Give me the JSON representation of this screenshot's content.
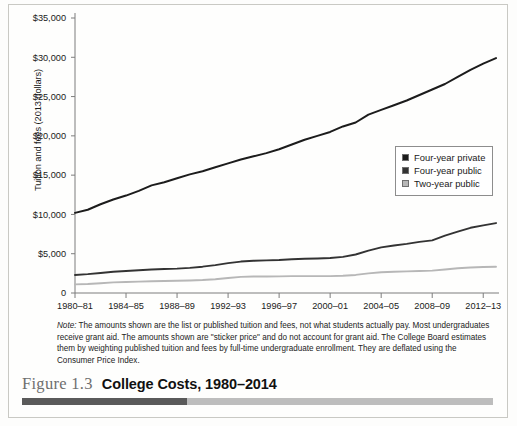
{
  "figure": {
    "number_label": "Figure 1.3",
    "title": "College Costs, 1980–2014",
    "note_label": "Note:",
    "note_text": " The amounts shown are the list or published tuition and fees, not what students actually pay. Most undergraduates receive grant aid. The amounts shown are \"sticker price\" and do not account for grant aid. The College Board estimates them by weighting published tuition and fees by full-time undergraduate enrollment. They are deflated using the Consumer Price Index."
  },
  "legend": {
    "position": "inside-right-middle",
    "items": [
      {
        "label": "Four-year private",
        "color": "#1c1c1c"
      },
      {
        "label": "Four-year public",
        "color": "#333333"
      },
      {
        "label": "Two-year public",
        "color": "#b7b7b7"
      }
    ]
  },
  "chart_data": {
    "type": "line",
    "title": "College Costs, 1980–2014",
    "xlabel": "",
    "ylabel": "Tuition and fees (2013 dollars)",
    "ylim": [
      0,
      35000
    ],
    "ytick_labels": [
      "0",
      "$5,000",
      "$10,000",
      "$15,000",
      "$20,000",
      "$25,000",
      "$30,000",
      "$35,000"
    ],
    "ytick_values": [
      0,
      5000,
      10000,
      15000,
      20000,
      25000,
      30000,
      35000
    ],
    "grid": false,
    "xtick_labels": [
      "1980–81",
      "1984–85",
      "1988–89",
      "1992–93",
      "1996–97",
      "2000–01",
      "2004–05",
      "2008–09",
      "2012–13"
    ],
    "x": [
      "1980-81",
      "1981-82",
      "1982-83",
      "1983-84",
      "1984-85",
      "1985-86",
      "1986-87",
      "1987-88",
      "1988-89",
      "1989-90",
      "1990-91",
      "1991-92",
      "1992-93",
      "1993-94",
      "1994-95",
      "1995-96",
      "1996-97",
      "1997-98",
      "1998-99",
      "1999-00",
      "2000-01",
      "2001-02",
      "2002-03",
      "2003-04",
      "2004-05",
      "2005-06",
      "2006-07",
      "2007-08",
      "2008-09",
      "2009-10",
      "2010-11",
      "2011-12",
      "2012-13",
      "2013-14"
    ],
    "series": [
      {
        "name": "Four-year private",
        "color": "#1c1c1c",
        "values": [
          10200,
          10600,
          11300,
          11900,
          12400,
          13000,
          13700,
          14100,
          14600,
          15100,
          15500,
          16000,
          16500,
          17000,
          17400,
          17800,
          18300,
          18900,
          19500,
          20000,
          20500,
          21200,
          21700,
          22700,
          23300,
          23900,
          24500,
          25200,
          25900,
          26600,
          27500,
          28400,
          29200,
          29900
        ]
      },
      {
        "name": "Four-year public",
        "color": "#333333",
        "values": [
          2300,
          2400,
          2550,
          2700,
          2800,
          2900,
          3000,
          3050,
          3100,
          3200,
          3350,
          3550,
          3800,
          4000,
          4100,
          4150,
          4200,
          4300,
          4350,
          4400,
          4450,
          4600,
          4900,
          5400,
          5800,
          6050,
          6250,
          6500,
          6700,
          7300,
          7800,
          8300,
          8600,
          8900
        ]
      },
      {
        "name": "Two-year public",
        "color": "#b7b7b7",
        "values": [
          1100,
          1150,
          1250,
          1350,
          1400,
          1450,
          1500,
          1520,
          1560,
          1600,
          1650,
          1750,
          1900,
          2050,
          2100,
          2100,
          2120,
          2150,
          2150,
          2150,
          2150,
          2200,
          2300,
          2500,
          2650,
          2700,
          2750,
          2800,
          2850,
          3000,
          3150,
          3250,
          3300,
          3350
        ]
      }
    ]
  }
}
